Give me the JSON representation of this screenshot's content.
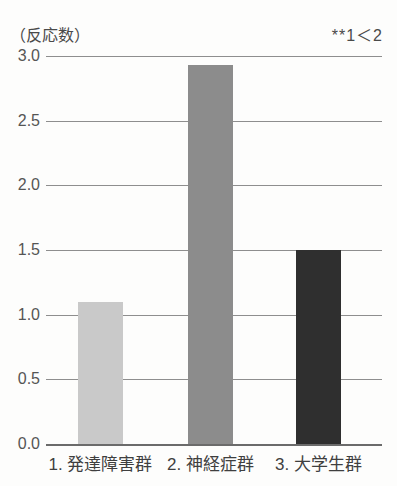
{
  "chart_data": {
    "type": "bar",
    "title": "",
    "subtitle": "",
    "xlabel": "",
    "ylabel": "（反応数）",
    "ylim": [
      0.0,
      3.0
    ],
    "grid": true,
    "legend": null,
    "annotations": [
      "**1＜2"
    ],
    "categories": [
      "1. 発達障害群",
      "2. 神経症群",
      "3. 大学生群"
    ],
    "values": [
      1.1,
      2.93,
      1.5
    ],
    "ytick_labels": [
      "0.0",
      "0.5",
      "1.0",
      "1.5",
      "2.0",
      "2.5",
      "3.0"
    ],
    "ytick_values": [
      0.0,
      0.5,
      1.0,
      1.5,
      2.0,
      2.5,
      3.0
    ],
    "bar_colors": [
      "#c9c9c9",
      "#8c8c8c",
      "#2f2f2f"
    ],
    "bars": [
      {
        "category": "1. 発達障害群",
        "value": 1.1,
        "color": "#c9c9c9"
      },
      {
        "category": "2. 神経症群",
        "value": 2.93,
        "color": "#8c8c8c"
      },
      {
        "category": "3. 大学生群",
        "value": 1.5,
        "color": "#2f2f2f"
      }
    ]
  },
  "axis": {
    "y_unit_caption": "（反応数）"
  },
  "annotation": {
    "significance": "**1＜2"
  }
}
